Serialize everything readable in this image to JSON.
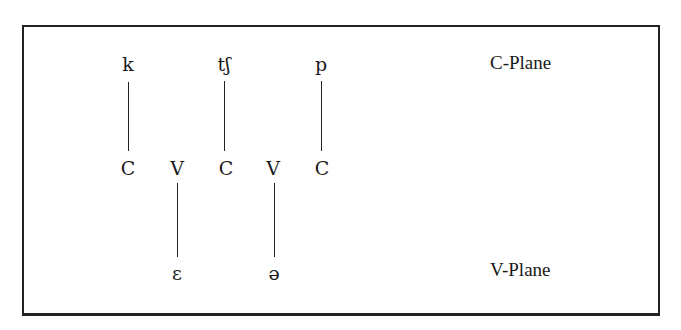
{
  "diagram": {
    "c_plane": {
      "label": "C-Plane",
      "segments": [
        "k",
        "tʃ",
        "p"
      ]
    },
    "skeleton": [
      "C",
      "V",
      "C",
      "V",
      "C"
    ],
    "v_plane": {
      "label": "V-Plane",
      "segments": [
        "ɛ",
        "ə"
      ]
    }
  }
}
